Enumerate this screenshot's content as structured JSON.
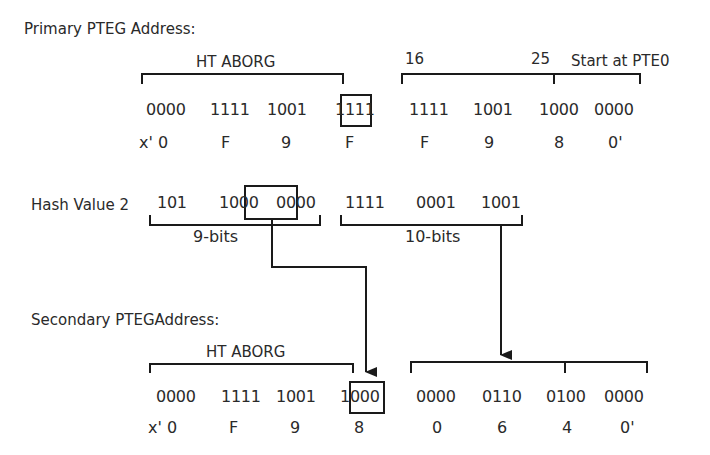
{
  "primary": {
    "title": "Primary PTEG Address:",
    "field_label": "HT ABORG",
    "range_start": "16",
    "range_end": "25",
    "range_note": "Start at PTE0",
    "bits": [
      "0000",
      "1111",
      "1001",
      "1111",
      "1111",
      "1001",
      "1000",
      "0000"
    ],
    "hex": [
      "x' 0",
      "F",
      "9",
      "F",
      "F",
      "9",
      "8",
      "0'"
    ]
  },
  "hash": {
    "label": "Hash Value 2",
    "bits": [
      "101",
      "1000",
      "0000",
      "1111",
      "0001",
      "1001"
    ],
    "group1_label": "9-bits",
    "group2_label": "10-bits"
  },
  "secondary": {
    "title": "Secondary PTEGAddress:",
    "field_label": "HT ABORG",
    "bits": [
      "0000",
      "1111",
      "1001",
      "1000",
      "0000",
      "0110",
      "0100",
      "0000"
    ],
    "hex": [
      "x' 0",
      "F",
      "9",
      "8",
      "0",
      "6",
      "4",
      "0'"
    ]
  },
  "colors": {
    "line": "#1a1a1a",
    "text": "#2a2a2a",
    "background": "#ffffff"
  }
}
